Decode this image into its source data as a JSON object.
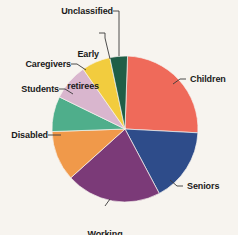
{
  "background_color": "#f7f4ef",
  "chart_data": {
    "type": "pie",
    "title": "",
    "subtitle": "",
    "xlabel": "",
    "ylabel": "",
    "legend_position": "none",
    "grid": false,
    "labels_outside": true,
    "leader_lines": true,
    "center": {
      "x": 125,
      "y": 129
    },
    "radius": 73,
    "start_angle_deg": 2,
    "direction": "clockwise",
    "categories": [
      "Children",
      "Seniors",
      "Working poor",
      "Disabled",
      "Students",
      "Caregivers",
      "Early retirees",
      "Unclassified"
    ],
    "values": [
      25,
      16,
      21,
      11,
      8,
      8,
      7,
      4
    ],
    "units": "percent",
    "colors": [
      "#ef6a5a",
      "#2e4c8a",
      "#7b3a78",
      "#f0994a",
      "#4fae8b",
      "#d9b6ce",
      "#f2cc3e",
      "#1f5e47"
    ],
    "slices": [
      {
        "label": "Children",
        "value": 25,
        "color": "#ef6a5a",
        "start_deg": 2,
        "end_deg": 93
      },
      {
        "label": "Seniors",
        "value": 16,
        "color": "#2e4c8a",
        "start_deg": 93,
        "end_deg": 152
      },
      {
        "label": "Working poor",
        "value": 21,
        "color": "#7b3a78",
        "start_deg": 152,
        "end_deg": 228
      },
      {
        "label": "Disabled",
        "value": 11,
        "color": "#f0994a",
        "start_deg": 228,
        "end_deg": 268
      },
      {
        "label": "Students",
        "value": 8,
        "color": "#4fae8b",
        "start_deg": 268,
        "end_deg": 296
      },
      {
        "label": "Caregivers",
        "value": 8,
        "color": "#d9b6ce",
        "start_deg": 296,
        "end_deg": 325
      },
      {
        "label": "Early retirees",
        "value": 7,
        "color": "#f2cc3e",
        "start_deg": 325,
        "end_deg": 348
      },
      {
        "label": "Unclassified",
        "value": 4,
        "color": "#1f5e47",
        "start_deg": 348,
        "end_deg": 362
      }
    ]
  },
  "labels": {
    "children": "Children",
    "seniors": "Seniors",
    "working_poor_line1": "Working",
    "working_poor_line2": "poor",
    "disabled": "Disabled",
    "students": "Students",
    "caregivers": "Caregivers",
    "early_retirees_line1": "Early",
    "early_retirees_line2": "retirees",
    "unclassified": "Unclassified"
  }
}
